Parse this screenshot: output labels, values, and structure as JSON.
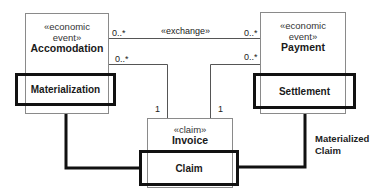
{
  "diagram": {
    "classes": [
      {
        "id": "accomodation",
        "stereotype": "«economic event»",
        "stereo_line1": "«economic",
        "stereo_line2": "event»",
        "name": "Accomodation"
      },
      {
        "id": "payment",
        "stereotype": "«economic event»",
        "stereo_line1": "«economic",
        "stereo_line2": "event»",
        "name": "Payment"
      },
      {
        "id": "invoice",
        "stereotype": "«claim»",
        "name": "Invoice"
      }
    ],
    "highlights": [
      {
        "id": "materialization",
        "label": "Materialization"
      },
      {
        "id": "settlement",
        "label": "Settlement"
      },
      {
        "id": "claim",
        "label": "Claim"
      }
    ],
    "associations": [
      {
        "label": "«exchange»",
        "from": "Accomodation",
        "to": "Payment",
        "from_mult": "0..*",
        "to_mult": "0..*"
      },
      {
        "label": "",
        "from": "Accomodation",
        "to": "Invoice",
        "from_mult": "0..*",
        "to_mult": "1"
      },
      {
        "label": "",
        "from": "Payment",
        "to": "Invoice",
        "from_mult": "0..*",
        "to_mult": "1"
      }
    ],
    "materialized_claim": {
      "line1": "Materialized",
      "line2": "Claim"
    },
    "colors": {
      "thin_border": "#8a8a8a",
      "thick_border": "#111111",
      "background": "#ffffff"
    }
  }
}
